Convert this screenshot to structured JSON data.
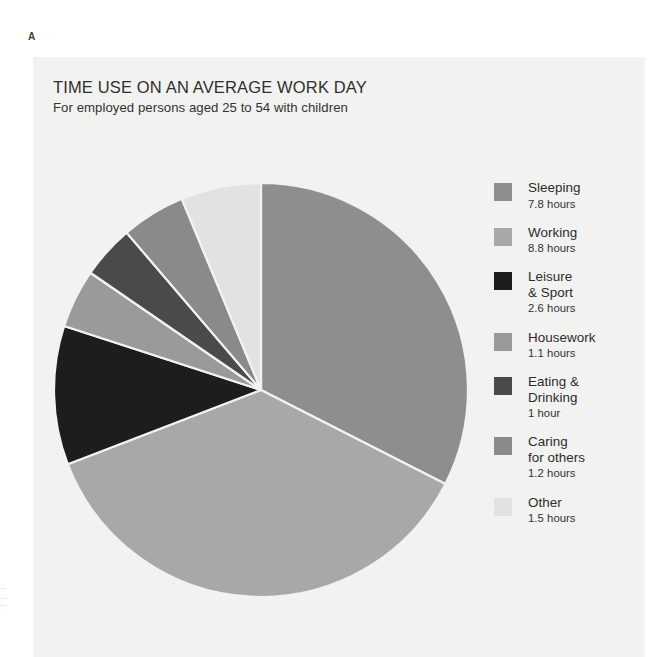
{
  "figure": {
    "letter": "A",
    "margin_note": "·|·|··|·"
  },
  "chart_panel": {
    "background_color": "#f2f2f1"
  },
  "header": {
    "title": "TIME USE ON AN AVERAGE WORK DAY",
    "subtitle": "For employed persons aged 25 to 54 with children"
  },
  "chart_data": {
    "type": "pie",
    "title": "TIME USE ON AN AVERAGE WORK DAY",
    "subtitle": "For employed persons aged 25 to 54 with children",
    "unit": "hours",
    "total": 24,
    "start_angle_deg": 0,
    "direction": "clockwise",
    "legend_position": "right",
    "grid": false,
    "categories": [
      "Sleeping",
      "Working",
      "Leisure & Sport",
      "Housework",
      "Eating & Drinking",
      "Caring for others",
      "Other"
    ],
    "values": [
      7.8,
      8.8,
      2.6,
      1.1,
      1.0,
      1.2,
      1.5
    ],
    "colors": [
      "#8e8e8e",
      "#a8a8a8",
      "#1d1d1d",
      "#9a9a9a",
      "#4a4a4a",
      "#8a8a8a",
      "#e2e2e2"
    ],
    "slices": [
      {
        "label": "Sleeping",
        "value": 7.8,
        "value_text": "7.8 hours",
        "color": "#8e8e8e"
      },
      {
        "label": "Working",
        "value": 8.8,
        "value_text": "8.8 hours",
        "color": "#a8a8a8"
      },
      {
        "label": "Leisure\n& Sport",
        "value": 2.6,
        "value_text": "2.6 hours",
        "color": "#1d1d1d"
      },
      {
        "label": "Housework",
        "value": 1.1,
        "value_text": "1.1 hours",
        "color": "#9a9a9a"
      },
      {
        "label": "Eating &\nDrinking",
        "value": 1.0,
        "value_text": "1 hour",
        "color": "#4a4a4a"
      },
      {
        "label": "Caring\nfor others",
        "value": 1.2,
        "value_text": "1.2 hours",
        "color": "#8a8a8a"
      },
      {
        "label": "Other",
        "value": 1.5,
        "value_text": "1.5 hours",
        "color": "#e2e2e2"
      }
    ]
  },
  "geometry": {
    "center_x": 228,
    "center_y": 333,
    "radius": 207,
    "separator_color": "#f2f2f1",
    "separator_width": 2.2
  }
}
